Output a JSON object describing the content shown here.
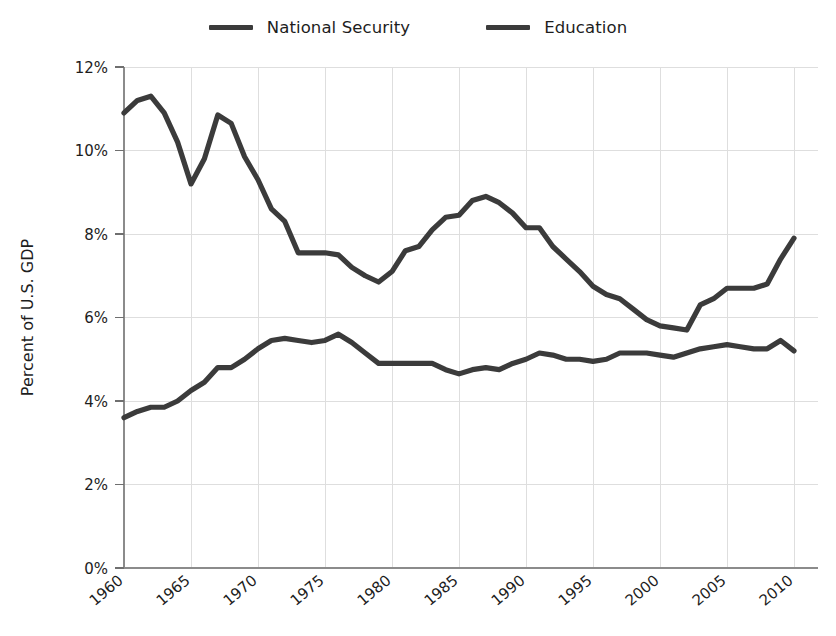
{
  "chart_data": {
    "type": "line",
    "title": "",
    "xlabel": "",
    "ylabel": "Percent of U.S. GDP",
    "xlim": [
      1959,
      2011
    ],
    "ylim": [
      0,
      12
    ],
    "grid": true,
    "legend_position": "top-center",
    "x_tick_labels": [
      "1960",
      "1965",
      "1970",
      "1975",
      "1980",
      "1985",
      "1990",
      "1995",
      "2000",
      "2005",
      "2010"
    ],
    "x_tick_values": [
      1960,
      1965,
      1970,
      1975,
      1980,
      1985,
      1990,
      1995,
      2000,
      2005,
      2010
    ],
    "y_tick_labels": [
      "0%",
      "2%",
      "4%",
      "6%",
      "8%",
      "10%",
      "12%"
    ],
    "y_tick_values": [
      0,
      2,
      4,
      6,
      8,
      10,
      12
    ],
    "x": [
      1960,
      1961,
      1962,
      1963,
      1964,
      1965,
      1966,
      1967,
      1968,
      1969,
      1970,
      1971,
      1972,
      1973,
      1974,
      1975,
      1976,
      1977,
      1978,
      1979,
      1980,
      1981,
      1982,
      1983,
      1984,
      1985,
      1986,
      1987,
      1988,
      1989,
      1990,
      1991,
      1992,
      1993,
      1994,
      1995,
      1996,
      1997,
      1998,
      1999,
      2000,
      2001,
      2002,
      2003,
      2004,
      2005,
      2006,
      2007,
      2008,
      2009,
      2010
    ],
    "series": [
      {
        "name": "National Security",
        "color": "#3b3b3b",
        "values": [
          10.9,
          11.2,
          11.3,
          10.9,
          10.2,
          9.2,
          9.8,
          10.85,
          10.65,
          9.85,
          9.3,
          8.6,
          8.3,
          7.55,
          7.55,
          7.55,
          7.5,
          7.2,
          7.0,
          6.85,
          7.1,
          7.6,
          7.7,
          8.1,
          8.4,
          8.45,
          8.8,
          8.9,
          8.75,
          8.5,
          8.15,
          8.15,
          7.7,
          7.4,
          7.1,
          6.75,
          6.55,
          6.45,
          6.2,
          5.95,
          5.8,
          5.75,
          5.7,
          6.3,
          6.45,
          6.7,
          6.7,
          6.7,
          6.8,
          7.4,
          7.9
        ]
      },
      {
        "name": "Education",
        "color": "#3b3b3b",
        "values": [
          3.6,
          3.75,
          3.85,
          3.85,
          4.0,
          4.25,
          4.45,
          4.8,
          4.8,
          5.0,
          5.25,
          5.45,
          5.5,
          5.45,
          5.4,
          5.45,
          5.6,
          5.4,
          5.15,
          4.9,
          4.9,
          4.9,
          4.9,
          4.9,
          4.75,
          4.65,
          4.75,
          4.8,
          4.75,
          4.9,
          5.0,
          5.15,
          5.1,
          5.0,
          5.0,
          4.95,
          5.0,
          5.15,
          5.15,
          5.15,
          5.1,
          5.05,
          5.15,
          5.25,
          5.3,
          5.35,
          5.3,
          5.25,
          5.25,
          5.45,
          5.2
        ]
      }
    ]
  },
  "legend": {
    "entries": [
      {
        "label": "National Security"
      },
      {
        "label": "Education"
      }
    ]
  },
  "axes": {
    "y_axis_title": "Percent of U.S. GDP"
  },
  "colors": {
    "series_stroke": "#3b3b3b",
    "gridline": "#dedede",
    "axis": "#8b8b8b",
    "text": "#1d1d1d",
    "background": "#ffffff"
  }
}
